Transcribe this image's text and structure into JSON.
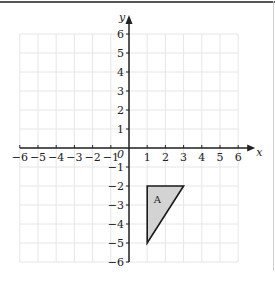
{
  "graph": {
    "x_axis_label": "x",
    "y_axis_label": "y",
    "origin_label": "0",
    "x_range": [
      -6,
      6
    ],
    "y_range": [
      -6,
      6
    ],
    "x_ticks": [
      "−6",
      "−5",
      "−4",
      "−3",
      "−2",
      "−1",
      "1",
      "2",
      "3",
      "4",
      "5",
      "6"
    ],
    "y_ticks": [
      "6",
      "5",
      "4",
      "3",
      "2",
      "1",
      "−1",
      "−2",
      "−3",
      "−4",
      "−5",
      "−6"
    ],
    "grid_color": "#e6e6e6",
    "axis_color": "#222222"
  },
  "shapes": [
    {
      "label": "A",
      "type": "triangle",
      "vertices": [
        [
          1,
          -2
        ],
        [
          3,
          -2
        ],
        [
          1,
          -5
        ]
      ],
      "fill": "#d3d3d3",
      "stroke": "#1a1a1a"
    }
  ]
}
